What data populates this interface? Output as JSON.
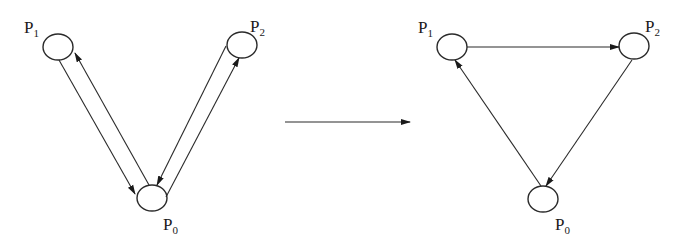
{
  "diagram": {
    "left_graph": {
      "nodes": [
        {
          "id": "P1",
          "label_main": "P",
          "label_sub": "1",
          "cx": 58,
          "cy": 47,
          "lx": 24,
          "ly": 33
        },
        {
          "id": "P2",
          "label_main": "P",
          "label_sub": "2",
          "cx": 242,
          "cy": 45,
          "lx": 250,
          "ly": 32
        },
        {
          "id": "P0",
          "label_main": "P",
          "label_sub": "0",
          "cx": 152,
          "cy": 198,
          "lx": 163,
          "ly": 230
        }
      ],
      "edges": [
        {
          "from": "P1",
          "to": "P0"
        },
        {
          "from": "P0",
          "to": "P1"
        },
        {
          "from": "P2",
          "to": "P0"
        },
        {
          "from": "P0",
          "to": "P2"
        }
      ]
    },
    "transition_arrow": {
      "x1": 285,
      "y1": 122,
      "x2": 410,
      "y2": 122
    },
    "right_graph": {
      "nodes": [
        {
          "id": "P1",
          "label_main": "P",
          "label_sub": "1",
          "cx": 452,
          "cy": 47,
          "lx": 418,
          "ly": 33
        },
        {
          "id": "P2",
          "label_main": "P",
          "label_sub": "2",
          "cx": 634,
          "cy": 46,
          "lx": 645,
          "ly": 32
        },
        {
          "id": "P0",
          "label_main": "P",
          "label_sub": "0",
          "cx": 543,
          "cy": 199,
          "lx": 555,
          "ly": 230
        }
      ],
      "edges": [
        {
          "from": "P1",
          "to": "P2"
        },
        {
          "from": "P2",
          "to": "P0"
        },
        {
          "from": "P0",
          "to": "P1"
        }
      ]
    }
  }
}
